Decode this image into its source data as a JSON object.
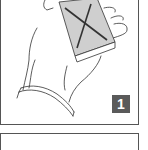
{
  "panels": [
    {
      "step_number": "1",
      "illustration": "hand-holding-card-deck-marked-x"
    },
    {
      "step_number": "",
      "illustration": ""
    }
  ],
  "colors": {
    "frame": "#555555",
    "badge_bg": "#5a5a5a",
    "badge_text": "#ffffff",
    "deck_fill": "#cfcfcf",
    "ink": "#333333"
  }
}
